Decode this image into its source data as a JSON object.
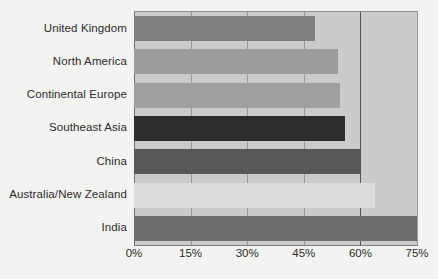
{
  "chart_data": {
    "type": "bar",
    "orientation": "horizontal",
    "title": "",
    "subtitle": "",
    "xlabel": "",
    "ylabel": "",
    "categories": [
      "United Kingdom",
      "North America",
      "Continental Europe",
      "Southeast Asia",
      "China",
      "Australia/New Zealand",
      "India"
    ],
    "values": [
      48,
      54,
      54.5,
      56,
      60,
      64,
      75
    ],
    "value_suffix": "%",
    "xlim": [
      0,
      75
    ],
    "xticks": [
      0,
      15,
      30,
      45,
      60,
      75
    ],
    "xtick_labels": [
      "0%",
      "15%",
      "30%",
      "45%",
      "60%",
      "75%"
    ],
    "grid": true,
    "legend": "none",
    "bar_colors": [
      "#808080",
      "#9d9d9d",
      "#a0a0a0",
      "#2c2c2c",
      "#585858",
      "#dcdcdc",
      "#6e6e6e"
    ],
    "plot_background": "#cbcbcb",
    "page_background": "#f3f3f1",
    "gridline_color": "#9a9a9a",
    "major_gridline_color": "#555555",
    "text_color": "#2b2b2b"
  }
}
